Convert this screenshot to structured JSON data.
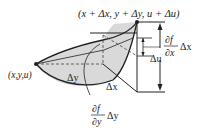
{
  "diagram": {
    "top_point_label": "(x + Δx, y + Δy, u + Δu)",
    "origin_label": "(x,y,u)",
    "delta_y_label": "Δy",
    "delta_x_label": "Δx",
    "delta_u_label": "Δu",
    "partial_x": {
      "numerator": "∂f",
      "denominator": "∂x",
      "factor": "Δx"
    },
    "partial_y": {
      "numerator": "∂f",
      "denominator": "∂y",
      "factor": "Δy"
    },
    "colors": {
      "surface_fill": "#d9d9d9",
      "stroke": "#222222"
    }
  }
}
